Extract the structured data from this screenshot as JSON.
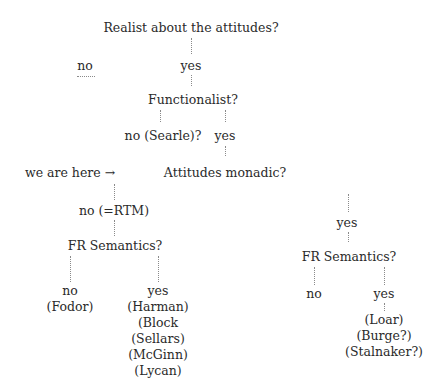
{
  "diagram": {
    "type": "decision-tree",
    "nodes": {
      "root": "Realist about the attitudes?",
      "root_no": "no",
      "root_yes": "yes",
      "functionalist": "Functionalist?",
      "functionalist_no": "no (Searle)?",
      "functionalist_yes": "yes",
      "here_marker": "we are here →",
      "monadic": "Attitudes monadic?",
      "monadic_no": "no (=RTM)",
      "monadic_yes": "yes",
      "fr_left": "FR Semantics?",
      "fr_left_no": "no",
      "fr_left_no_names": [
        "(Fodor)"
      ],
      "fr_left_yes": "yes",
      "fr_left_yes_names": [
        "(Harman)",
        "(Block",
        "(Sellars)",
        "(McGinn)",
        "(Lycan)"
      ],
      "fr_right": "FR Semantics?",
      "fr_right_no": "no",
      "fr_right_yes": "yes",
      "fr_right_yes_names": [
        "(Loar)",
        "(Burge?)",
        "(Stalnaker?)"
      ]
    },
    "edges": [
      [
        "root",
        "root_no"
      ],
      [
        "root",
        "root_yes"
      ],
      [
        "root_yes",
        "functionalist"
      ],
      [
        "functionalist",
        "functionalist_no"
      ],
      [
        "functionalist",
        "functionalist_yes"
      ],
      [
        "functionalist_yes",
        "monadic"
      ],
      [
        "monadic",
        "monadic_no"
      ],
      [
        "monadic",
        "monadic_yes"
      ],
      [
        "monadic_no",
        "fr_left"
      ],
      [
        "monadic_yes",
        "fr_right"
      ],
      [
        "fr_left",
        "fr_left_no"
      ],
      [
        "fr_left",
        "fr_left_yes"
      ],
      [
        "fr_right",
        "fr_right_no"
      ],
      [
        "fr_right",
        "fr_right_yes"
      ]
    ],
    "colors": {
      "text": "#2a2a2a",
      "dots": "#8a8a8a",
      "background": "#ffffff"
    }
  }
}
